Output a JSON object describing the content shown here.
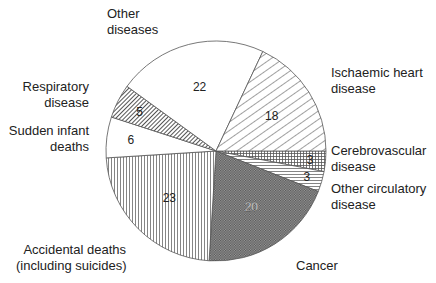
{
  "chart_data": {
    "type": "pie",
    "title": "",
    "center": [
      216,
      151
    ],
    "radius": 110,
    "start_angle_deg": 0,
    "direction": "clockwise",
    "slices": [
      {
        "label": "Cerebrovascular disease",
        "value": 3,
        "pattern": "grid"
      },
      {
        "label": "Other circulatory disease",
        "value": 3,
        "pattern": "hlines"
      },
      {
        "label": "Cancer",
        "value": 20,
        "pattern": "crosshatch-dense"
      },
      {
        "label": "Accidental deaths (including suicides)",
        "value": 23,
        "pattern": "vlines"
      },
      {
        "label": "Sudden infant deaths",
        "value": 6,
        "pattern": "none"
      },
      {
        "label": "Respiratory disease",
        "value": 5,
        "pattern": "diag-dense"
      },
      {
        "label": "Other diseases",
        "value": 22,
        "pattern": "none"
      },
      {
        "label": "Ischaemic heart disease",
        "value": 18,
        "pattern": "diag-sparse"
      }
    ],
    "total": 100
  },
  "labels": {
    "other_diseases": [
      "Other",
      "diseases"
    ],
    "ischaemic": [
      "Ischaemic heart",
      "disease"
    ],
    "respiratory": [
      "Respiratory",
      "disease"
    ],
    "sudden_infant": [
      "Sudden infant",
      "deaths"
    ],
    "cerebrovascular": [
      "Cerebrovascular",
      "disease"
    ],
    "other_circulatory": [
      "Other circulatory",
      "disease"
    ],
    "accidental": [
      "Accidental deaths",
      "(including suicides)"
    ],
    "cancer": [
      "Cancer"
    ]
  }
}
